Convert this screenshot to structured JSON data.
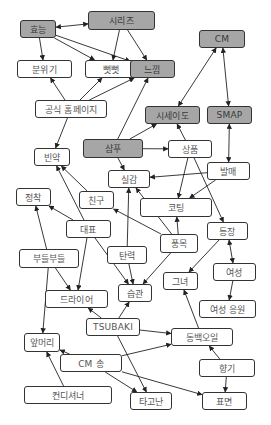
{
  "diagram": {
    "type": "concept-network",
    "colors": {
      "highlight_fill": "#a6a6a6",
      "normal_fill": "#ffffff",
      "border": "#333333",
      "edge": "#222222"
    },
    "nodes": [
      {
        "id": "hyoneung",
        "label": "효능",
        "x": 20,
        "y": 20,
        "w": 36,
        "h": 18,
        "highlight": true
      },
      {
        "id": "series",
        "label": "시리즈",
        "x": 88,
        "y": 11,
        "w": 67,
        "h": 19,
        "highlight": true
      },
      {
        "id": "cm",
        "label": "CM",
        "x": 199,
        "y": 30,
        "w": 46,
        "h": 18,
        "highlight": true
      },
      {
        "id": "atmosphere",
        "label": "분위기",
        "x": 17,
        "y": 60,
        "w": 55,
        "h": 18,
        "highlight": false
      },
      {
        "id": "stiff",
        "label": "뻣뻣",
        "x": 85,
        "y": 60,
        "w": 52,
        "h": 18,
        "highlight": false
      },
      {
        "id": "feeling",
        "label": "느낌",
        "x": 130,
        "y": 60,
        "w": 45,
        "h": 18,
        "highlight": true
      },
      {
        "id": "homepage",
        "label": "공식 홈페이지",
        "x": 35,
        "y": 100,
        "w": 72,
        "h": 18,
        "highlight": false
      },
      {
        "id": "shiseido",
        "label": "시세이도",
        "x": 145,
        "y": 106,
        "w": 55,
        "h": 18,
        "highlight": true
      },
      {
        "id": "smap",
        "label": "SMAP",
        "x": 207,
        "y": 106,
        "w": 45,
        "h": 18,
        "highlight": true
      },
      {
        "id": "shampoo",
        "label": "샴푸",
        "x": 83,
        "y": 139,
        "w": 60,
        "h": 19,
        "highlight": true
      },
      {
        "id": "product",
        "label": "상품",
        "x": 168,
        "y": 140,
        "w": 44,
        "h": 18,
        "highlight": false
      },
      {
        "id": "scanty",
        "label": "빈약",
        "x": 34,
        "y": 148,
        "w": 36,
        "h": 18,
        "highlight": false
      },
      {
        "id": "release",
        "label": "발매",
        "x": 207,
        "y": 162,
        "w": 43,
        "h": 18,
        "highlight": false
      },
      {
        "id": "realize",
        "label": "실감",
        "x": 108,
        "y": 170,
        "w": 42,
        "h": 18,
        "highlight": false
      },
      {
        "id": "settle",
        "label": "정착",
        "x": 16,
        "y": 188,
        "w": 35,
        "h": 18,
        "highlight": false
      },
      {
        "id": "friend",
        "label": "친구",
        "x": 79,
        "y": 191,
        "w": 35,
        "h": 18,
        "highlight": false
      },
      {
        "id": "coating",
        "label": "코팅",
        "x": 140,
        "y": 198,
        "w": 72,
        "h": 19,
        "highlight": false
      },
      {
        "id": "representative",
        "label": "대표",
        "x": 66,
        "y": 220,
        "w": 45,
        "h": 18,
        "highlight": false
      },
      {
        "id": "appearance",
        "label": "등장",
        "x": 207,
        "y": 222,
        "w": 41,
        "h": 18,
        "highlight": false
      },
      {
        "id": "soft",
        "label": "부들부들",
        "x": 19,
        "y": 249,
        "w": 60,
        "h": 19,
        "highlight": false
      },
      {
        "id": "elasticity",
        "label": "탄력",
        "x": 107,
        "y": 246,
        "w": 40,
        "h": 18,
        "highlight": false
      },
      {
        "id": "volume",
        "label": "풍목",
        "x": 160,
        "y": 234,
        "w": 38,
        "h": 19,
        "highlight": false
      },
      {
        "id": "woman",
        "label": "여성",
        "x": 213,
        "y": 263,
        "w": 43,
        "h": 18,
        "highlight": false
      },
      {
        "id": "she",
        "label": "그녀",
        "x": 163,
        "y": 272,
        "w": 35,
        "h": 18,
        "highlight": false
      },
      {
        "id": "habit",
        "label": "습관",
        "x": 118,
        "y": 284,
        "w": 34,
        "h": 18,
        "highlight": false
      },
      {
        "id": "dryer",
        "label": "드라이어",
        "x": 45,
        "y": 290,
        "w": 63,
        "h": 18,
        "highlight": false
      },
      {
        "id": "cheer",
        "label": "여성 응원",
        "x": 199,
        "y": 300,
        "w": 57,
        "h": 18,
        "highlight": false
      },
      {
        "id": "tsubaki",
        "label": "TSUBAKI",
        "x": 86,
        "y": 318,
        "w": 54,
        "h": 18,
        "highlight": false
      },
      {
        "id": "bangs",
        "label": "앞머리",
        "x": 24,
        "y": 333,
        "w": 36,
        "h": 19,
        "highlight": false
      },
      {
        "id": "camellia",
        "label": "동백오일",
        "x": 171,
        "y": 328,
        "w": 62,
        "h": 18,
        "highlight": false
      },
      {
        "id": "cmsong",
        "label": "CM 송",
        "x": 60,
        "y": 354,
        "w": 62,
        "h": 18,
        "highlight": false
      },
      {
        "id": "scent",
        "label": "향기",
        "x": 199,
        "y": 359,
        "w": 56,
        "h": 18,
        "highlight": false
      },
      {
        "id": "conditioner",
        "label": "컨디셔너",
        "x": 24,
        "y": 386,
        "w": 88,
        "h": 18,
        "highlight": false
      },
      {
        "id": "innate",
        "label": "타고난",
        "x": 130,
        "y": 392,
        "w": 42,
        "h": 18,
        "highlight": false
      },
      {
        "id": "surface",
        "label": "표면",
        "x": 202,
        "y": 392,
        "w": 45,
        "h": 18,
        "highlight": false
      }
    ],
    "edges": [
      {
        "from": "series",
        "to": "hyoneung",
        "bidirectional": true
      },
      {
        "from": "hyoneung",
        "to": "atmosphere"
      },
      {
        "from": "hyoneung",
        "to": "stiff"
      },
      {
        "from": "hyoneung",
        "to": "feeling"
      },
      {
        "from": "series",
        "to": "stiff"
      },
      {
        "from": "series",
        "to": "feeling"
      },
      {
        "from": "homepage",
        "to": "atmosphere"
      },
      {
        "from": "homepage",
        "to": "stiff"
      },
      {
        "from": "homepage",
        "to": "feeling"
      },
      {
        "from": "homepage",
        "to": "scanty"
      },
      {
        "from": "shampoo",
        "to": "feeling"
      },
      {
        "from": "cm",
        "to": "shiseido",
        "bidirectional": true
      },
      {
        "from": "cm",
        "to": "smap",
        "bidirectional": true
      },
      {
        "from": "shampoo",
        "to": "shiseido"
      },
      {
        "from": "shampoo",
        "to": "product"
      },
      {
        "from": "shampoo",
        "to": "realize"
      },
      {
        "from": "product",
        "to": "shiseido"
      },
      {
        "from": "product",
        "to": "coating"
      },
      {
        "from": "product",
        "to": "appearance"
      },
      {
        "from": "smap",
        "to": "release",
        "bidirectional": true
      },
      {
        "from": "release",
        "to": "realize"
      },
      {
        "from": "release",
        "to": "coating"
      },
      {
        "from": "friend",
        "to": "scanty"
      },
      {
        "from": "representative",
        "to": "scanty"
      },
      {
        "from": "representative",
        "to": "settle"
      },
      {
        "from": "representative",
        "to": "dryer"
      },
      {
        "from": "representative",
        "to": "habit"
      },
      {
        "from": "soft",
        "to": "settle"
      },
      {
        "from": "soft",
        "to": "dryer"
      },
      {
        "from": "soft",
        "to": "bangs"
      },
      {
        "from": "volume",
        "to": "friend"
      },
      {
        "from": "volume",
        "to": "realize"
      },
      {
        "from": "volume",
        "to": "coating"
      },
      {
        "from": "volume",
        "to": "habit"
      },
      {
        "from": "elasticity",
        "to": "realize"
      },
      {
        "from": "elasticity",
        "to": "habit"
      },
      {
        "from": "appearance",
        "to": "woman",
        "bidirectional": true
      },
      {
        "from": "appearance",
        "to": "she"
      },
      {
        "from": "woman",
        "to": "cheer"
      },
      {
        "from": "tsubaki",
        "to": "dryer"
      },
      {
        "from": "tsubaki",
        "to": "habit"
      },
      {
        "from": "tsubaki",
        "to": "camellia"
      },
      {
        "from": "tsubaki",
        "to": "innate"
      },
      {
        "from": "camellia",
        "to": "she"
      },
      {
        "from": "scent",
        "to": "camellia"
      },
      {
        "from": "scent",
        "to": "surface"
      },
      {
        "from": "cmsong",
        "to": "bangs"
      },
      {
        "from": "cmsong",
        "to": "camellia"
      },
      {
        "from": "cmsong",
        "to": "innate"
      },
      {
        "from": "cmsong",
        "to": "surface"
      },
      {
        "from": "conditioner",
        "to": "bangs"
      }
    ]
  }
}
